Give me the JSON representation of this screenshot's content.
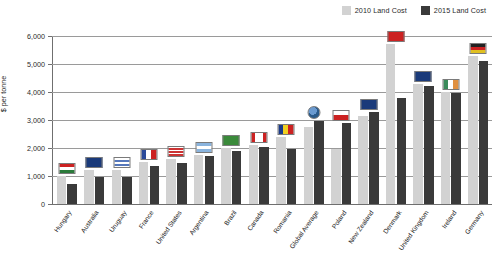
{
  "chart_data": {
    "type": "bar",
    "title": "",
    "xlabel": "",
    "ylabel": "$ per tonne",
    "ylim": [
      0,
      6000
    ],
    "ytick_labels": [
      "6,000",
      "5,000",
      "4,000",
      "3,000",
      "2,000",
      "1,000",
      "0"
    ],
    "yticks": [
      6000,
      5000,
      4000,
      3000,
      2000,
      1000,
      0
    ],
    "grid": true,
    "legend_position": "top-right",
    "categories": [
      "Hungary",
      "Australia",
      "Uruguay",
      "France",
      "United States",
      "Argentina",
      "Brazil",
      "Canada",
      "Romania",
      "Global Average",
      "Poland",
      "New Zealand",
      "Denmark",
      "United Kingdom",
      "Ireland",
      "Germany"
    ],
    "series": [
      {
        "name": "2010 Land Cost",
        "color": "#d2d2d2",
        "values": [
          1000,
          1200,
          1200,
          1500,
          1600,
          1750,
          2000,
          2100,
          2400,
          2750,
          1950,
          3150,
          5700,
          4300,
          4000,
          5300
        ]
      },
      {
        "name": "2015 Land Cost",
        "color": "#3a3a3a",
        "values": [
          700,
          950,
          950,
          1350,
          1450,
          1700,
          1900,
          2050,
          1950,
          2950,
          2900,
          3300,
          3800,
          4200,
          3950,
          5100
        ]
      }
    ]
  },
  "legend": {
    "items": [
      {
        "label": "2010 Land Cost",
        "color": "#d2d2d2"
      },
      {
        "label": "2015 Land Cost",
        "color": "#3a3a3a"
      }
    ]
  },
  "flags": [
    "flag-hungary",
    "flag-australia",
    "flag-uruguay",
    "flag-france",
    "flag-united-states",
    "flag-argentina",
    "flag-brazil",
    "flag-canada",
    "flag-romania",
    "globe-icon",
    "flag-poland",
    "flag-new-zealand",
    "flag-denmark",
    "flag-united-kingdom",
    "flag-ireland",
    "flag-germany"
  ]
}
